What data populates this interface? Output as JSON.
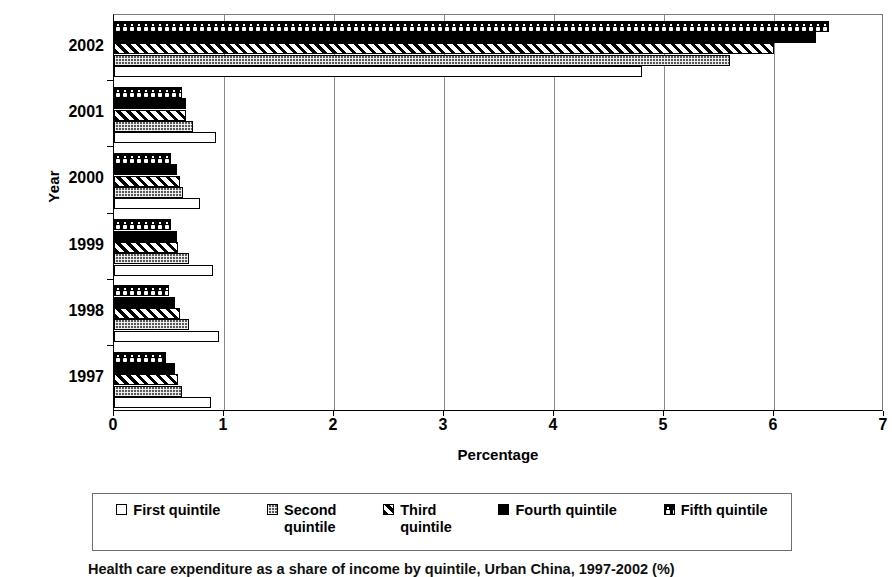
{
  "chart_data": {
    "type": "bar",
    "orientation": "horizontal",
    "title": "",
    "xlabel": "Percentage",
    "ylabel": "Year",
    "categories": [
      "1997",
      "1998",
      "1999",
      "2000",
      "2001",
      "2002"
    ],
    "xlim": [
      0,
      7
    ],
    "xticks": [
      "0",
      "1",
      "2",
      "3",
      "4",
      "5",
      "6",
      "7"
    ],
    "grid": true,
    "legend_position": "bottom",
    "series": [
      {
        "name": "First quintile",
        "pattern": "solid-white",
        "values": [
          0.88,
          0.95,
          0.9,
          0.78,
          0.93,
          4.8
        ]
      },
      {
        "name": "Second quintile",
        "pattern": "grey-crosshatch",
        "values": [
          0.62,
          0.68,
          0.68,
          0.63,
          0.72,
          5.6
        ]
      },
      {
        "name": "Third quintile",
        "pattern": "diagonal-stripes",
        "values": [
          0.58,
          0.6,
          0.58,
          0.6,
          0.65,
          6.0
        ]
      },
      {
        "name": "Fourth quintile",
        "pattern": "solid-black",
        "values": [
          0.55,
          0.55,
          0.57,
          0.57,
          0.65,
          6.38
        ]
      },
      {
        "name": "Fifth quintile",
        "pattern": "black-with-white-dots",
        "values": [
          0.47,
          0.5,
          0.52,
          0.52,
          0.62,
          6.5
        ]
      }
    ]
  },
  "axes": {
    "y_title": "Year",
    "x_title": "Percentage",
    "y_tick_labels": [
      "2002",
      "2001",
      "2000",
      "1999",
      "1998",
      "1997"
    ],
    "x_tick_labels": [
      "0",
      "1",
      "2",
      "3",
      "4",
      "5",
      "6",
      "7"
    ]
  },
  "legend": {
    "items": [
      {
        "label": "First quintile",
        "swatch": "first-quintile-swatch"
      },
      {
        "label": "Second\nquintile",
        "swatch": "second-quintile-swatch"
      },
      {
        "label": "Third\nquintile",
        "swatch": "third-quintile-swatch"
      },
      {
        "label": "Fourth quintile",
        "swatch": "fourth-quintile-swatch"
      },
      {
        "label": "Fifth quintile",
        "swatch": "fifth-quintile-swatch"
      }
    ]
  },
  "caption": {
    "text": "Health care expenditure as a share of income by quintile, Urban China, 1997-2002 (%)"
  },
  "colors": {
    "axis": "#000000",
    "gridline": "#8a8a8a",
    "second_quintile": "#595959",
    "fourth_quintile": "#000000",
    "background": "#ffffff"
  }
}
